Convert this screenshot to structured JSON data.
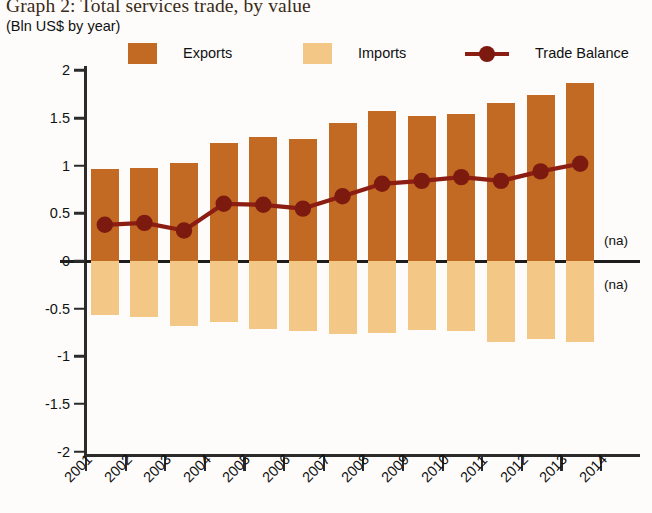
{
  "title": "Graph 2: Total services trade, by value",
  "subtitle": "(Bln US$ by year)",
  "colors": {
    "exports": "#c26a24",
    "imports": "#f3c786",
    "trade_balance": "#8c1d12",
    "axis": "#2b2b2b",
    "background": "#fdfcfa"
  },
  "legend": {
    "position": "top",
    "items": [
      {
        "label": "Exports",
        "icon": "square-swatch-icon",
        "color": "#c26a24"
      },
      {
        "label": "Imports",
        "icon": "square-swatch-icon",
        "color": "#f3c786"
      },
      {
        "label": "Trade Balance",
        "icon": "line-marker-icon",
        "color": "#8c1d12"
      }
    ]
  },
  "annotations": [
    {
      "name": "na-above-zero",
      "text": "(na)"
    },
    {
      "name": "na-below-zero",
      "text": "(na)"
    }
  ],
  "chart_data": {
    "type": "bar",
    "title": "Graph 2: Total services trade, by value",
    "subtitle": "(Bln US$ by year)",
    "xlabel": "",
    "ylabel": "(Bln US$ by year)",
    "ylim": [
      -2,
      2
    ],
    "yticks": [
      2,
      1.5,
      1,
      0.5,
      0,
      -0.5,
      -1,
      -1.5,
      -2
    ],
    "ytick_labels": [
      "2",
      "1.5",
      "1",
      "0.5",
      "0",
      "-0.5",
      "-1",
      "-1.5",
      "-2"
    ],
    "grid": false,
    "legend_position": "top",
    "categories": [
      "2001",
      "2002",
      "2003",
      "2004",
      "2005",
      "2006",
      "2007",
      "2008",
      "2009",
      "2010",
      "2011",
      "2012",
      "2013"
    ],
    "xtick_labels": [
      "2001",
      "2002",
      "2003",
      "2004",
      "2005",
      "2006",
      "2007",
      "2008",
      "2009",
      "2010",
      "2011",
      "2012",
      "2013",
      "2014"
    ],
    "series": [
      {
        "name": "Exports",
        "type": "bar",
        "color": "#c26a24",
        "values": [
          0.97,
          0.98,
          1.03,
          1.24,
          1.3,
          1.28,
          1.45,
          1.57,
          1.52,
          1.54,
          1.66,
          1.74,
          1.87
        ]
      },
      {
        "name": "Imports",
        "type": "bar",
        "color": "#f3c786",
        "values": [
          -0.57,
          -0.59,
          -0.68,
          -0.64,
          -0.71,
          -0.73,
          -0.77,
          -0.76,
          -0.72,
          -0.73,
          -0.85,
          -0.82,
          -0.85
        ]
      },
      {
        "name": "Trade Balance",
        "type": "line",
        "color": "#8c1d12",
        "values": [
          0.38,
          0.4,
          0.32,
          0.6,
          0.59,
          0.55,
          0.68,
          0.81,
          0.84,
          0.88,
          0.84,
          0.94,
          1.02
        ]
      }
    ]
  }
}
